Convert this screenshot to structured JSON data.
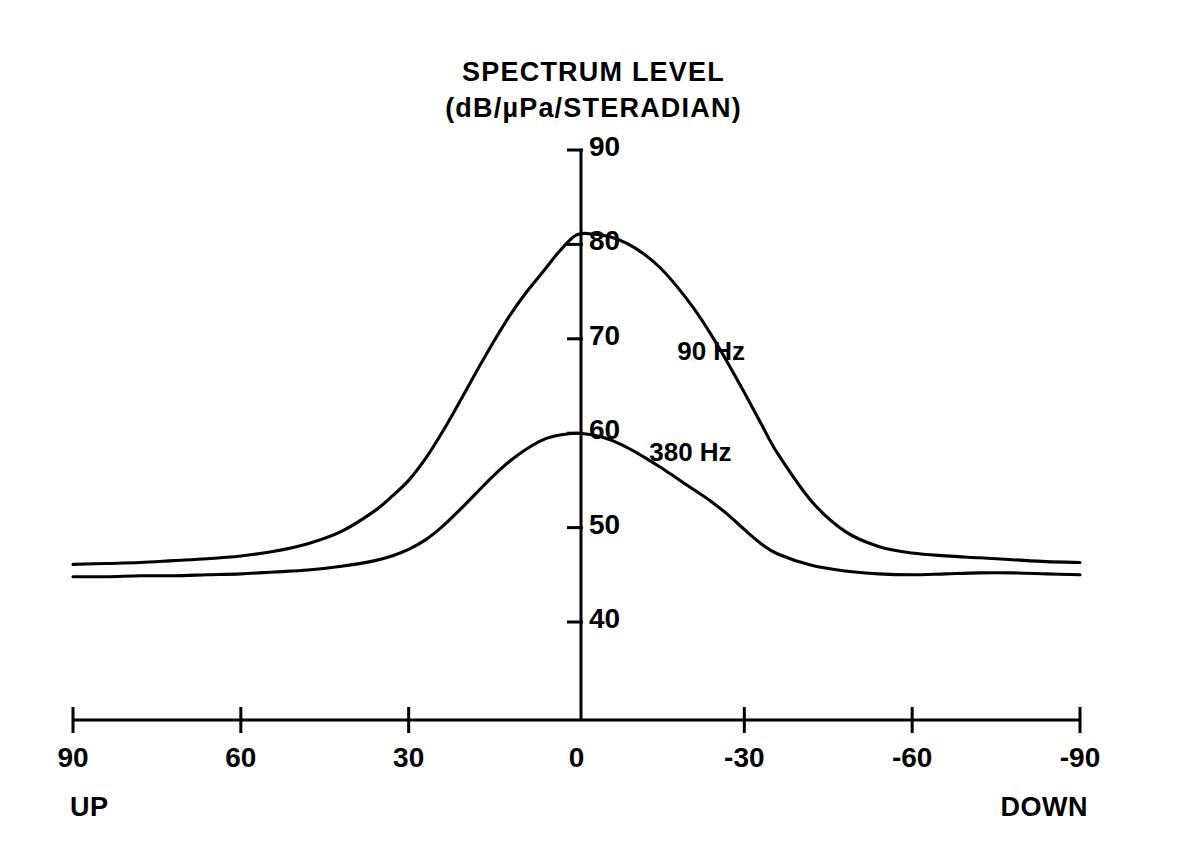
{
  "chart_data": {
    "type": "line",
    "title": "SPECTRUM LEVEL",
    "subtitle": "(dB/µPa/STERADIAN)",
    "title_lines": [
      "SPECTRUM LEVEL",
      "(dB/µPa/STERADIAN)"
    ],
    "xlabel": "",
    "ylabel": "SPECTRUM LEVEL (dB/µPa/STERADIAN)",
    "xlim": [
      90,
      -90
    ],
    "ylim": [
      36,
      92
    ],
    "x_axis_inverted": true,
    "grid": false,
    "legend_position": "inline-curve-labels",
    "x_ticks": [
      90,
      60,
      30,
      0,
      -30,
      -60,
      -90
    ],
    "x_tick_labels": [
      "90",
      "60",
      "30",
      "0",
      "-30",
      "-60",
      "-90"
    ],
    "y_ticks": [
      40,
      50,
      60,
      70,
      80,
      90
    ],
    "y_tick_labels": [
      "40",
      "50",
      "60",
      "70",
      "80",
      "90"
    ],
    "x_axis_end_labels": {
      "left": "UP",
      "right": "DOWN"
    },
    "line_color": "#000000",
    "series": [
      {
        "name": "90 Hz",
        "label": "90 Hz",
        "label_x_deg": -18,
        "label_y_db": 68.5,
        "x": [
          90,
          84,
          78,
          72,
          66,
          60,
          54,
          48,
          42,
          36,
          33,
          30,
          27,
          24,
          21,
          18,
          15,
          12,
          9,
          6,
          3,
          0,
          -3,
          -6,
          -9,
          -12,
          -15,
          -18,
          -21,
          -24,
          -27,
          -30,
          -33,
          -36,
          -42,
          -48,
          -54,
          -60,
          -66,
          -72,
          -78,
          -84,
          -90
        ],
        "values": [
          46.1,
          46.2,
          46.3,
          46.5,
          46.7,
          47.0,
          47.5,
          48.3,
          49.6,
          51.8,
          53.3,
          55.0,
          57.3,
          60.1,
          63.2,
          66.4,
          69.5,
          72.4,
          74.9,
          77.1,
          79.3,
          81.0,
          81.1,
          80.8,
          80.1,
          79.0,
          77.5,
          75.5,
          73.2,
          70.5,
          67.5,
          64.3,
          61.0,
          57.8,
          52.8,
          49.6,
          48.0,
          47.3,
          47.0,
          46.8,
          46.6,
          46.4,
          46.3
        ]
      },
      {
        "name": "380 Hz",
        "label": "380 Hz",
        "label_x_deg": -13,
        "label_y_db": 57.8,
        "x": [
          90,
          84,
          78,
          72,
          66,
          60,
          54,
          48,
          42,
          36,
          33,
          30,
          27,
          24,
          21,
          18,
          15,
          12,
          9,
          6,
          3,
          0,
          -3,
          -6,
          -9,
          -12,
          -15,
          -18,
          -21,
          -24,
          -27,
          -30,
          -33,
          -36,
          -42,
          -48,
          -54,
          -60,
          -66,
          -72,
          -78,
          -84,
          -90
        ],
        "values": [
          44.8,
          44.8,
          44.9,
          44.9,
          45.0,
          45.1,
          45.3,
          45.5,
          45.9,
          46.5,
          47.0,
          47.7,
          48.7,
          50.1,
          51.8,
          53.6,
          55.4,
          57.0,
          58.3,
          59.3,
          59.8,
          60.0,
          59.8,
          59.3,
          58.5,
          57.5,
          56.4,
          55.2,
          54.0,
          52.8,
          51.4,
          49.8,
          48.3,
          47.2,
          46.0,
          45.4,
          45.1,
          45.0,
          45.1,
          45.2,
          45.2,
          45.1,
          45.0
        ]
      }
    ]
  },
  "axes": {
    "x_axis_name": "elevation-angle-degrees",
    "y_axis_name": "spectrum-level-db"
  }
}
